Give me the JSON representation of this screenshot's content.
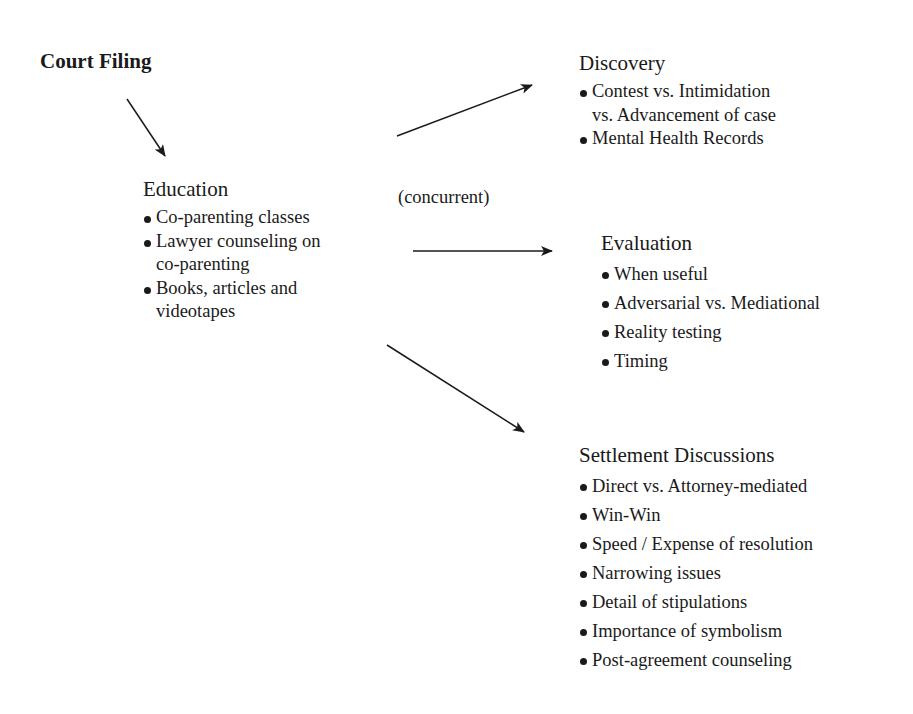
{
  "diagram": {
    "start": {
      "title": "Court Filing"
    },
    "education": {
      "title": "Education",
      "items": [
        {
          "line1": "Co-parenting classes",
          "line2": ""
        },
        {
          "line1": "Lawyer counseling on",
          "line2": "co-parenting"
        },
        {
          "line1": "Books, articles and",
          "line2": "videotapes"
        }
      ]
    },
    "concurrent_label": "(concurrent)",
    "discovery": {
      "title": "Discovery",
      "items": [
        {
          "line1": "Contest vs. Intimidation",
          "line2": "vs. Advancement of case"
        },
        {
          "line1": "Mental Health Records",
          "line2": ""
        }
      ]
    },
    "evaluation": {
      "title": "Evaluation",
      "items": [
        "When useful",
        "Adversarial vs. Mediational",
        "Reality testing",
        "Timing"
      ]
    },
    "settlement": {
      "title": "Settlement Discussions",
      "items": [
        "Direct vs. Attorney-mediated",
        "Win-Win",
        "Speed / Expense of resolution",
        "Narrowing issues",
        "Detail of stipulations",
        "Importance of symbolism",
        "Post-agreement counseling"
      ]
    },
    "edges": [
      {
        "from": "Court Filing",
        "to": "Education"
      },
      {
        "from": "Education",
        "to": "Discovery"
      },
      {
        "from": "Education",
        "to": "Evaluation"
      },
      {
        "from": "Education",
        "to": "Settlement Discussions"
      }
    ],
    "colors": {
      "ink": "#1a1a1a",
      "background": "#ffffff"
    }
  }
}
